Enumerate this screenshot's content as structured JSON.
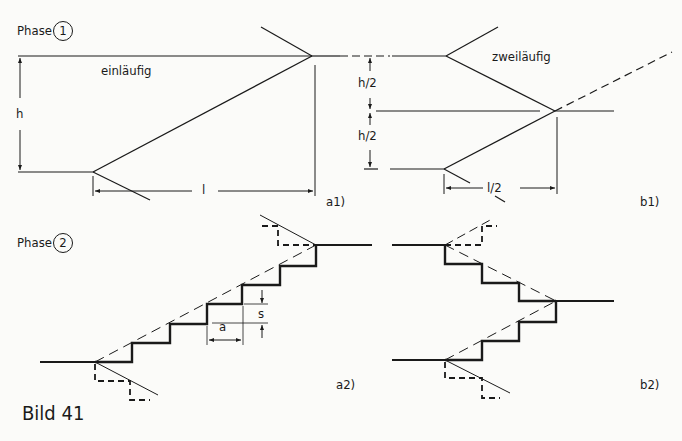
{
  "phase1": {
    "label": "Phase",
    "number": "1"
  },
  "phase2": {
    "label": "Phase",
    "number": "2"
  },
  "a1": {
    "title": "einläufig",
    "dim_h": "h",
    "dim_l": "l",
    "tag": "a1)"
  },
  "b1": {
    "title": "zweiläufig",
    "dim_h_upper": "h/2",
    "dim_h_lower": "h/2",
    "dim_l": "l/2",
    "tag": "b1)"
  },
  "a2": {
    "dim_a": "a",
    "dim_s": "s",
    "tag": "a2)"
  },
  "b2": {
    "tag": "b2)"
  },
  "caption": "Bild 41",
  "colors": {
    "ink": "#1a1a1a",
    "paper": "#fbfbf9"
  }
}
